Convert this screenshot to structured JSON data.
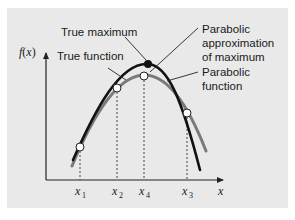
{
  "diagram": {
    "y_axis_label": "f(x)",
    "y_axis_label_parts": {
      "f": "f",
      "open": "(",
      "x": "x",
      "close": ")"
    },
    "x_axis_label": "x",
    "ticks": [
      {
        "base": "x",
        "sub": "1"
      },
      {
        "base": "x",
        "sub": "2"
      },
      {
        "base": "x",
        "sub": "4"
      },
      {
        "base": "x",
        "sub": "3"
      }
    ],
    "annotations": {
      "true_maximum": "True maximum",
      "true_function": "True function",
      "parabolic_approx_line1": "Parabolic",
      "parabolic_approx_line2": "approximation",
      "parabolic_approx_line3": "of maximum",
      "parabolic_function_line1": "Parabolic",
      "parabolic_function_line2": "function"
    },
    "colors": {
      "panel": "#e9e9e9",
      "true_function": "#111111",
      "parabolic_function": "#7a7a7a",
      "axis": "#222222"
    }
  }
}
